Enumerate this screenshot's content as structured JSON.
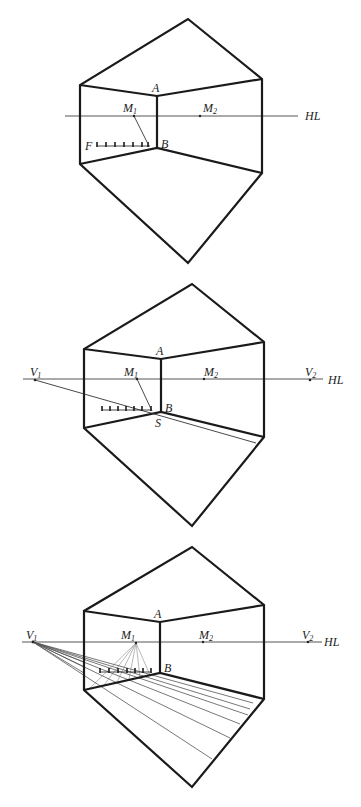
{
  "figures": [
    {
      "id": "fig1",
      "labels": {
        "A": "A",
        "B": "B",
        "F": "F",
        "M1": "M",
        "M1_sub": "1",
        "M2": "M",
        "M2_sub": "2",
        "HL": "HL"
      }
    },
    {
      "id": "fig2",
      "labels": {
        "A": "A",
        "B": "B",
        "S": "S",
        "M1": "M",
        "M1_sub": "1",
        "M2": "M",
        "M2_sub": "2",
        "V1": "V",
        "V1_sub": "1",
        "V2": "V",
        "V2_sub": "2",
        "HL": "HL"
      }
    },
    {
      "id": "fig3",
      "labels": {
        "A": "A",
        "B": "B",
        "M1": "M",
        "M1_sub": "1",
        "M2": "M",
        "M2_sub": "2",
        "V1": "V",
        "V1_sub": "1",
        "V2": "V",
        "V2_sub": "2",
        "HL": "HL"
      }
    }
  ],
  "colors": {
    "line": "#1a1a1a",
    "horizon": "#555555",
    "background": "#ffffff"
  }
}
